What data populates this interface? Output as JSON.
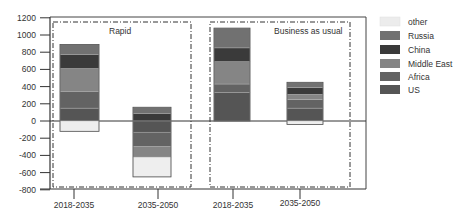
{
  "chart_data": {
    "type": "bar",
    "stacked": true,
    "title": "",
    "xlabel": "",
    "ylabel": "",
    "ylim": [
      -800,
      1200
    ],
    "yticks": [
      1200,
      1000,
      800,
      600,
      400,
      200,
      0,
      -200,
      -400,
      -600,
      -800
    ],
    "grid": false,
    "legend_position": "right",
    "groups": [
      {
        "name": "Rapid",
        "categories": [
          "2018-2035",
          "2035-2050"
        ]
      },
      {
        "name": "Business as usual",
        "categories": [
          "2018-2035",
          "2035-2050"
        ]
      }
    ],
    "categories": [
      "2018-2035",
      "2035-2050",
      "2018-2035",
      "2035-2050"
    ],
    "series": [
      {
        "name": "US",
        "color": "#555555",
        "values": [
          150,
          -130,
          330,
          150
        ]
      },
      {
        "name": "Africa",
        "color": "#636363",
        "values": [
          190,
          -170,
          100,
          100
        ]
      },
      {
        "name": "Middle East",
        "color": "#858585",
        "values": [
          270,
          -120,
          260,
          60
        ]
      },
      {
        "name": "China",
        "color": "#3a3a3a",
        "values": [
          160,
          90,
          160,
          80
        ]
      },
      {
        "name": "Russia",
        "color": "#717171",
        "values": [
          120,
          70,
          230,
          60
        ]
      },
      {
        "name": "other",
        "color": "#eeeeee",
        "values": [
          -120,
          -230,
          0,
          -40
        ]
      }
    ],
    "totals_top": [
      890,
      230,
      1040,
      450
    ],
    "totals_bottom": [
      -120,
      -720,
      0,
      -40
    ]
  },
  "legend": {
    "items": [
      {
        "label": "other",
        "color": "#ececec"
      },
      {
        "label": "Russia",
        "color": "#717171"
      },
      {
        "label": "China",
        "color": "#3a3a3a"
      },
      {
        "label": "Middle East",
        "color": "#858585"
      },
      {
        "label": "Africa",
        "color": "#636363"
      },
      {
        "label": "US",
        "color": "#555555"
      }
    ]
  },
  "axis": {
    "y_ticks": [
      "1200",
      "1000",
      "800",
      "600",
      "400",
      "200",
      "0",
      "-200",
      "-400",
      "-600",
      "-800"
    ],
    "x_labels": [
      "2018-2035",
      "2035-2050",
      "2018-2035",
      "2035-2050"
    ]
  },
  "boxes": {
    "rapid": "Rapid",
    "bau": "Business as usual"
  }
}
